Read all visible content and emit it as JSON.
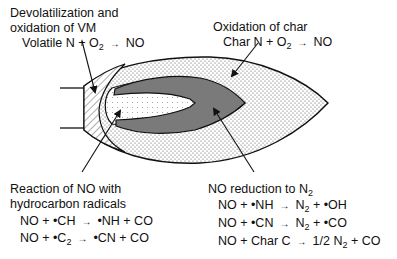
{
  "diagram": {
    "type": "coal-flame-nox-zones",
    "colors": {
      "outline": "#1a1a1a",
      "char_zone_fill": "#e6e6e6",
      "reduction_zone_fill": "#7a7a7a",
      "volatile_zone_fill": "#f2f2f2",
      "background": "#ffffff"
    }
  },
  "labels": {
    "devol": {
      "title_line1": "Devolatilization and",
      "title_line2": "oxidation of VM",
      "eq": {
        "lhs": "Volatile N + O",
        "lhs_sub": "2",
        "rhs": "NO"
      }
    },
    "char": {
      "title": "Oxidation of char",
      "eq": {
        "lhs": "Char N + O",
        "lhs_sub": "2",
        "rhs": "NO"
      }
    },
    "hydrocarbon": {
      "title_line1": "Reaction of NO with",
      "title_line2": "hydrocarbon radicals",
      "eqs": [
        {
          "lhs": "NO + •CH",
          "lhs_sub": "",
          "rhs": "•NH + CO",
          "rhs_pre": "",
          "rhs_sub": ""
        },
        {
          "lhs": "NO + •C",
          "lhs_sub": "2",
          "rhs": "•CN + CO",
          "rhs_pre": "",
          "rhs_sub": ""
        }
      ]
    },
    "reduction": {
      "title": "NO reduction to N",
      "title_sub": "2",
      "eqs": [
        {
          "lhs": "NO + •NH",
          "rhs_pre": "N",
          "rhs_sub": "2",
          "rhs": " + •OH"
        },
        {
          "lhs": "NO + •CN",
          "rhs_pre": "N",
          "rhs_sub": "2",
          "rhs": " + •CO"
        },
        {
          "lhs": "NO + Char C",
          "rhs_pre": "1/2 N",
          "rhs_sub": "2",
          "rhs": " + CO"
        }
      ]
    },
    "arrow_glyph": "→"
  }
}
